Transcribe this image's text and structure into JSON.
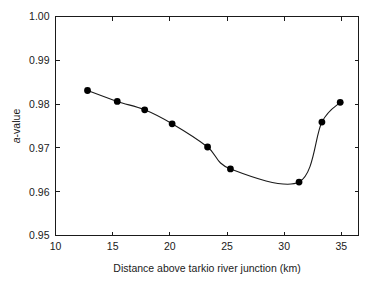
{
  "chart_data": {
    "type": "line",
    "title": "",
    "xlabel": "Distance above tarkio river junction (km)",
    "ylabel": "a-value",
    "ylabel_parts": {
      "italic": "a",
      "rest": "-value"
    },
    "xlim": [
      10,
      36.5
    ],
    "ylim": [
      0.95,
      1.0
    ],
    "xticks": [
      10,
      15,
      20,
      25,
      30,
      35
    ],
    "xtick_labels": [
      "10",
      "15",
      "20",
      "25",
      "30",
      "35"
    ],
    "yticks": [
      0.95,
      0.96,
      0.97,
      0.98,
      0.99,
      1.0
    ],
    "ytick_labels": [
      "0.95",
      "0.96",
      "0.97",
      "0.98",
      "0.99",
      "1.00"
    ],
    "grid": false,
    "legend": null,
    "marker": "filled-circle",
    "line_style": "smooth-spline",
    "x": [
      12.8,
      15.4,
      17.8,
      20.2,
      23.3,
      25.3,
      31.3,
      33.3,
      34.9
    ],
    "values": [
      0.9831,
      0.9806,
      0.9787,
      0.9755,
      0.9702,
      0.9652,
      0.9622,
      0.9759,
      0.9804
    ],
    "series": [
      {
        "name": "a-value",
        "x": [
          12.8,
          15.4,
          17.8,
          20.2,
          23.3,
          25.3,
          31.3,
          33.3,
          34.9
        ],
        "values": [
          0.9831,
          0.9806,
          0.9787,
          0.9755,
          0.9702,
          0.9652,
          0.9622,
          0.9759,
          0.9804
        ]
      }
    ],
    "colors": {
      "line": "#1a1a1a",
      "marker": "#000000",
      "axis": "#1a1a1a",
      "background": "#ffffff"
    }
  }
}
